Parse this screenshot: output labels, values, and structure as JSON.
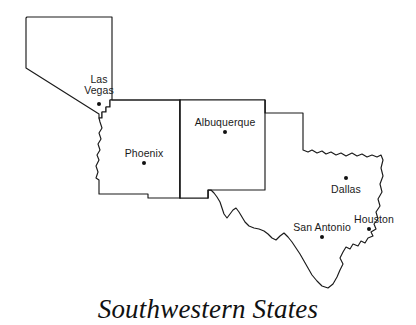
{
  "figure": {
    "title": "Southwestern States",
    "background_color": "#ffffff",
    "line_color": "#1a1a1a",
    "width": 416,
    "height": 325
  },
  "map": {
    "type": "political-outline-map",
    "region": "Southwestern United States",
    "states": [
      {
        "name": "Nevada",
        "label_shown": false
      },
      {
        "name": "Arizona",
        "label_shown": false
      },
      {
        "name": "New Mexico",
        "label_shown": false
      },
      {
        "name": "Texas",
        "label_shown": false
      }
    ],
    "cities": [
      {
        "name": "Las Vegas",
        "lines": [
          "Las",
          "Vegas"
        ],
        "label_x": 99,
        "label_y": 80,
        "dot_x": 99,
        "dot_y": 104,
        "dot_radius": 2.0,
        "state": "Nevada"
      },
      {
        "name": "Phoenix",
        "lines": [
          "Phoenix"
        ],
        "label_x": 144,
        "label_y": 148,
        "dot_x": 144,
        "dot_y": 163,
        "dot_radius": 2.0,
        "state": "Arizona"
      },
      {
        "name": "Albuquerque",
        "lines": [
          "Albuquerque"
        ],
        "label_x": 225,
        "label_y": 117,
        "dot_x": 225,
        "dot_y": 132,
        "dot_radius": 2.0,
        "state": "New Mexico"
      },
      {
        "name": "Dallas",
        "lines": [
          "Dallas"
        ],
        "label_x": 346,
        "label_y": 186,
        "dot_x": 346,
        "dot_y": 178,
        "dot_radius": 2.0,
        "state": "Texas"
      },
      {
        "name": "San Antonio",
        "lines": [
          "San Antonio"
        ],
        "label_x": 322,
        "label_y": 222,
        "dot_x": 322,
        "dot_y": 237,
        "dot_radius": 2.0,
        "state": "Texas"
      },
      {
        "name": "Houston",
        "lines": [
          "Houston"
        ],
        "label_x": 374,
        "label_y": 214,
        "dot_x": 369,
        "dot_y": 229,
        "dot_radius": 2.0,
        "state": "Texas"
      }
    ]
  }
}
